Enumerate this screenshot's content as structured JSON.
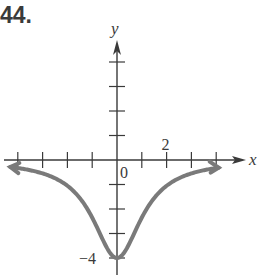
{
  "problem_number": "44.",
  "chart_data": {
    "type": "line",
    "title": "",
    "xlabel": "x",
    "ylabel": "y",
    "xlim": [
      -4.4,
      5
    ],
    "ylim": [
      -4.6,
      4.5
    ],
    "x_ticks": [
      -4,
      -3,
      -2,
      -1,
      1,
      2,
      3,
      4
    ],
    "y_ticks": [
      -4,
      -3,
      -2,
      -1,
      1,
      2,
      3,
      4
    ],
    "tick_labels": [
      {
        "axis": "x",
        "value": 2,
        "text": "2"
      },
      {
        "axis": "origin",
        "value": 0,
        "text": "0"
      },
      {
        "axis": "y",
        "value": -4,
        "text": "−4"
      }
    ],
    "series": [
      {
        "name": "f(x)",
        "color": "#7a7a7a",
        "description": "even function with minimum (0, -4), approaching y=0 as x -> +/- infinity",
        "x": [
          -4,
          -3,
          -2,
          -1,
          0,
          1,
          2,
          3,
          4
        ],
        "y": [
          -0.33,
          -0.55,
          -1.05,
          -2.35,
          -4,
          -2.35,
          -1.05,
          -0.55,
          -0.33
        ],
        "arrows": [
          "left",
          "right"
        ]
      }
    ],
    "grid": false
  }
}
